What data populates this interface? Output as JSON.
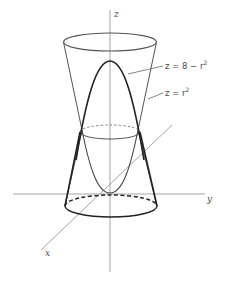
{
  "figure": {
    "type": "3d-surface-diagram",
    "axes": {
      "z_label": "z",
      "y_label": "y",
      "x_label": "x"
    },
    "surfaces": [
      {
        "name": "paraboloid",
        "equation_lhs": "z = 8 − r",
        "exponent": "2",
        "style": "bold"
      },
      {
        "name": "cone-like surface",
        "equation_lhs": "z = r",
        "exponent": "2",
        "style": "thin"
      }
    ],
    "colors": {
      "axis": "#9a9a9a",
      "surface_outline": "#555555",
      "bold_curve": "#222222",
      "text": "#4a4a4a"
    }
  }
}
